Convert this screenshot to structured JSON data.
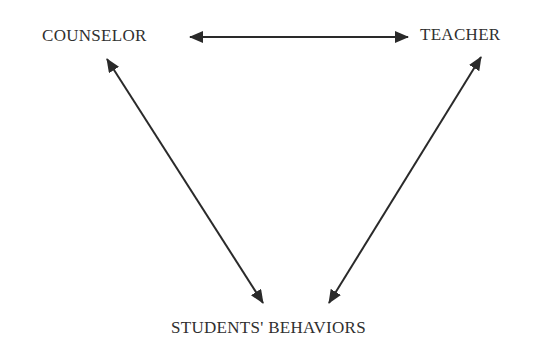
{
  "diagram": {
    "nodes": [
      {
        "id": "counselor",
        "label": "COUNSELOR"
      },
      {
        "id": "teacher",
        "label": "TEACHER"
      },
      {
        "id": "students_behaviors",
        "label": "STUDENTS' BEHAVIORS"
      }
    ],
    "edges": [
      {
        "from": "counselor",
        "to": "teacher",
        "type": "bidirectional"
      },
      {
        "from": "counselor",
        "to": "students_behaviors",
        "type": "bidirectional"
      },
      {
        "from": "teacher",
        "to": "students_behaviors",
        "type": "bidirectional"
      }
    ],
    "colors": {
      "line": "#2a2a2a",
      "text": "#2f2f2f",
      "background": "#ffffff"
    }
  }
}
